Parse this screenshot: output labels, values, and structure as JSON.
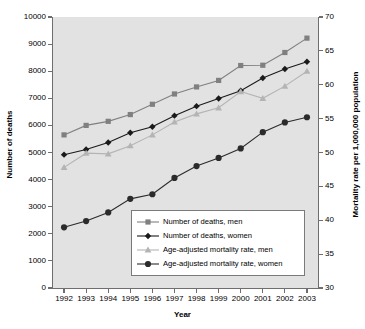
{
  "chart_data": {
    "type": "line",
    "title": "",
    "xlabel": "Year",
    "ylabel": "Number of deaths",
    "ylabel_secondary": "Mortality rate per 1,000,000 population",
    "categories": [
      "1992",
      "1993",
      "1994",
      "1995",
      "1996",
      "1997",
      "1998",
      "1999",
      "2000",
      "2001",
      "2002",
      "2003"
    ],
    "x": [
      1992,
      1993,
      1994,
      1995,
      1996,
      1997,
      1998,
      1999,
      2000,
      2001,
      2002,
      2003
    ],
    "ylim": [
      0,
      10000
    ],
    "yticks": [
      0,
      1000,
      2000,
      3000,
      4000,
      5000,
      6000,
      7000,
      8000,
      9000,
      10000
    ],
    "ylim_secondary": [
      30,
      70
    ],
    "yticks_secondary": [
      30,
      35,
      40,
      45,
      50,
      55,
      60,
      65,
      70
    ],
    "grid": false,
    "legend_position": "lower center",
    "series": [
      {
        "name": "Number of deaths, men",
        "axis": "left",
        "marker": "square",
        "color": "#808080",
        "line_color": "#808080",
        "values": [
          5650,
          6000,
          6150,
          6400,
          6780,
          7160,
          7420,
          7660,
          8210,
          8220,
          8690,
          9220
        ]
      },
      {
        "name": "Number of deaths, women",
        "axis": "left",
        "marker": "diamond",
        "color": "#1a1a1a",
        "line_color": "#1a1a1a",
        "values": [
          4920,
          5110,
          5370,
          5730,
          5950,
          6360,
          6710,
          6990,
          7280,
          7750,
          8080,
          8350
        ]
      },
      {
        "name": "Age-adjusted mortality rate, men",
        "axis": "right",
        "marker": "triangle",
        "color": "#b4b4b4",
        "line_color": "#b4b4b4",
        "values": [
          47.8,
          49.9,
          49.8,
          51.0,
          52.6,
          54.5,
          55.7,
          56.6,
          59.0,
          58.0,
          59.8,
          62.0
        ]
      },
      {
        "name": "Age-adjusted mortality rate, women",
        "axis": "left",
        "marker": "circle",
        "color": "#2b2b2b",
        "line_color": "#2b2b2b",
        "values": [
          2240,
          2470,
          2790,
          3290,
          3460,
          4060,
          4500,
          4800,
          5150,
          5750,
          6110,
          6300
        ]
      }
    ]
  },
  "legend": {
    "items": [
      {
        "label": "Number of deaths, men"
      },
      {
        "label": "Number of deaths, women"
      },
      {
        "label": "Age-adjusted mortality rate, men"
      },
      {
        "label": "Age-adjusted mortality rate, women"
      }
    ]
  }
}
